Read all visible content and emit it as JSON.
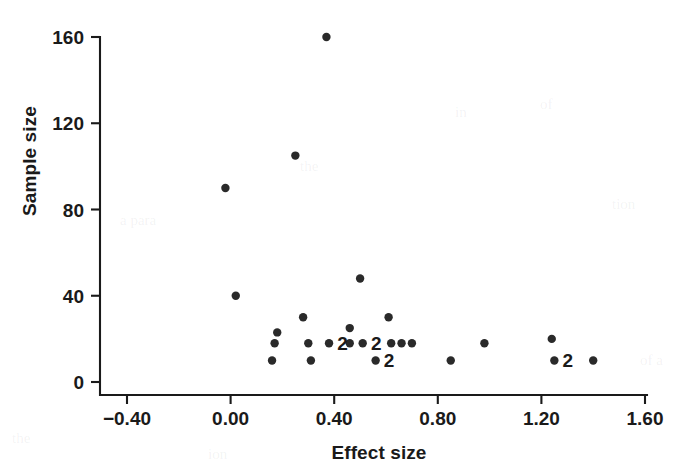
{
  "chart_data": {
    "type": "scatter",
    "title": "",
    "xlabel": "Effect size",
    "ylabel": "Sample size",
    "xlim": [
      -0.4,
      1.6
    ],
    "ylim": [
      0,
      160
    ],
    "xticks": [
      "-0.40",
      "0.00",
      "0.40",
      "0.80",
      "1.20",
      "1.60"
    ],
    "xtick_values": [
      -0.4,
      0.0,
      0.4,
      0.8,
      1.2,
      1.6
    ],
    "yticks": [
      "0",
      "40",
      "80",
      "120",
      "160"
    ],
    "ytick_values": [
      0,
      40,
      80,
      120,
      160
    ],
    "grid": false,
    "legend": null,
    "marker": "filled-circle",
    "marker_color": "#2a2a2a",
    "marker_radius": 4.2,
    "overlap_label_note": "A '2' printed beside a marker denotes two coincident observations at that location",
    "points": [
      {
        "x": -0.02,
        "y": 90,
        "n": 1
      },
      {
        "x": 0.02,
        "y": 40,
        "n": 1
      },
      {
        "x": 0.16,
        "y": 10,
        "n": 1
      },
      {
        "x": 0.17,
        "y": 18,
        "n": 1
      },
      {
        "x": 0.18,
        "y": 23,
        "n": 1
      },
      {
        "x": 0.25,
        "y": 105,
        "n": 1
      },
      {
        "x": 0.28,
        "y": 30,
        "n": 1
      },
      {
        "x": 0.3,
        "y": 18,
        "n": 1
      },
      {
        "x": 0.31,
        "y": 10,
        "n": 1
      },
      {
        "x": 0.37,
        "y": 160,
        "n": 1
      },
      {
        "x": 0.38,
        "y": 18,
        "n": 2
      },
      {
        "x": 0.46,
        "y": 18,
        "n": 1
      },
      {
        "x": 0.46,
        "y": 25,
        "n": 1
      },
      {
        "x": 0.5,
        "y": 48,
        "n": 1
      },
      {
        "x": 0.51,
        "y": 18,
        "n": 2
      },
      {
        "x": 0.56,
        "y": 10,
        "n": 2
      },
      {
        "x": 0.61,
        "y": 30,
        "n": 1
      },
      {
        "x": 0.62,
        "y": 18,
        "n": 1
      },
      {
        "x": 0.66,
        "y": 18,
        "n": 1
      },
      {
        "x": 0.7,
        "y": 18,
        "n": 1
      },
      {
        "x": 0.85,
        "y": 10,
        "n": 1
      },
      {
        "x": 0.98,
        "y": 18,
        "n": 1
      },
      {
        "x": 1.24,
        "y": 20,
        "n": 1
      },
      {
        "x": 1.25,
        "y": 10,
        "n": 2
      },
      {
        "x": 1.4,
        "y": 10,
        "n": 1
      }
    ]
  },
  "bleed_artifacts": [
    {
      "text": "a para",
      "x": 120,
      "y": 212
    },
    {
      "text": "the",
      "x": 300,
      "y": 158
    },
    {
      "text": "in",
      "x": 455,
      "y": 104
    },
    {
      "text": "of",
      "x": 540,
      "y": 96
    },
    {
      "text": "tion",
      "x": 612,
      "y": 196
    },
    {
      "text": "the",
      "x": 12,
      "y": 430
    },
    {
      "text": "of a",
      "x": 640,
      "y": 352
    },
    {
      "text": "ion",
      "x": 208,
      "y": 446
    }
  ]
}
